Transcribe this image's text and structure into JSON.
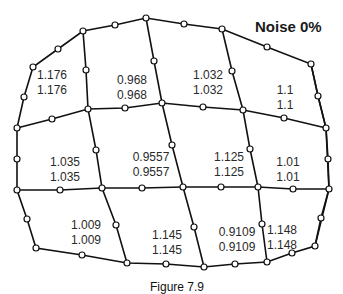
{
  "title": "Noise 0%",
  "caption": "Figure 7.9",
  "colors": {
    "line": "#111111",
    "text": "#2a2a2a",
    "background": "#ffffff"
  },
  "cells": [
    {
      "id": "r1c1",
      "top": "1.176",
      "bottom": "1.176",
      "x": 52,
      "y": 68
    },
    {
      "id": "r1c2",
      "top": "0.968",
      "bottom": "0.968",
      "x": 132,
      "y": 73
    },
    {
      "id": "r1c3",
      "top": "1.032",
      "bottom": "1.032",
      "x": 208,
      "y": 68
    },
    {
      "id": "r1c4",
      "top": "1.1",
      "bottom": "1.1",
      "x": 285,
      "y": 83
    },
    {
      "id": "r2c1",
      "top": "1.035",
      "bottom": "1.035",
      "x": 65,
      "y": 155
    },
    {
      "id": "r2c2",
      "top": "0.9557",
      "bottom": "0.9557",
      "x": 151,
      "y": 150
    },
    {
      "id": "r2c3",
      "top": "1.125",
      "bottom": "1.125",
      "x": 229,
      "y": 150
    },
    {
      "id": "r2c4",
      "top": "1.01",
      "bottom": "1.01",
      "x": 288,
      "y": 155
    },
    {
      "id": "r3c1",
      "top": "1.009",
      "bottom": "1.009",
      "x": 86,
      "y": 218
    },
    {
      "id": "r3c2",
      "top": "1.145",
      "bottom": "1.145",
      "x": 167,
      "y": 228
    },
    {
      "id": "r3c3",
      "top": "0.9109",
      "bottom": "0.9109",
      "x": 237,
      "y": 225
    },
    {
      "id": "r3c4",
      "top": "1.148",
      "bottom": "1.148",
      "x": 282,
      "y": 223
    }
  ],
  "mesh": {
    "polylines": [
      [
        [
          17,
          128
        ],
        [
          24,
          97
        ],
        [
          33,
          67
        ],
        [
          58,
          49
        ],
        [
          83,
          31
        ],
        [
          115,
          25
        ],
        [
          146,
          18
        ],
        [
          184,
          24
        ],
        [
          222,
          29
        ],
        [
          267,
          47
        ],
        [
          311,
          64
        ],
        [
          318,
          96
        ],
        [
          326,
          128
        ],
        [
          328,
          159
        ],
        [
          329,
          189
        ],
        [
          321,
          218
        ],
        [
          315,
          246
        ],
        [
          292,
          253
        ],
        [
          267,
          262
        ],
        [
          235,
          264
        ],
        [
          204,
          267
        ],
        [
          166,
          264
        ],
        [
          127,
          263
        ],
        [
          82,
          255
        ],
        [
          36,
          248
        ],
        [
          27,
          219
        ],
        [
          17,
          190
        ],
        [
          17,
          159
        ],
        [
          17,
          128
        ]
      ],
      [
        [
          17,
          128
        ],
        [
          52,
          119
        ],
        [
          88,
          109
        ],
        [
          125,
          108
        ],
        [
          162,
          103
        ],
        [
          203,
          107
        ],
        [
          243,
          110
        ],
        [
          284,
          118
        ],
        [
          326,
          128
        ]
      ],
      [
        [
          17,
          190
        ],
        [
          60,
          190
        ],
        [
          102,
          188
        ],
        [
          142,
          188
        ],
        [
          183,
          187
        ],
        [
          221,
          187
        ],
        [
          258,
          187
        ],
        [
          293,
          189
        ],
        [
          329,
          189
        ]
      ],
      [
        [
          83,
          31
        ],
        [
          86,
          70
        ],
        [
          88,
          109
        ],
        [
          96,
          150
        ],
        [
          102,
          188
        ],
        [
          116,
          225
        ],
        [
          127,
          263
        ]
      ],
      [
        [
          146,
          18
        ],
        [
          154,
          61
        ],
        [
          162,
          103
        ],
        [
          172,
          145
        ],
        [
          183,
          187
        ],
        [
          194,
          227
        ],
        [
          204,
          267
        ]
      ],
      [
        [
          222,
          29
        ],
        [
          232,
          71
        ],
        [
          243,
          110
        ],
        [
          250,
          149
        ],
        [
          258,
          187
        ],
        [
          262,
          224
        ],
        [
          267,
          262
        ]
      ],
      [
        [
          311,
          64
        ],
        [
          318,
          96
        ],
        [
          326,
          128
        ]
      ],
      [
        [
          326,
          128
        ],
        [
          329,
          189
        ],
        [
          315,
          246
        ]
      ]
    ],
    "nodes": [
      [
        17,
        128
      ],
      [
        24,
        97
      ],
      [
        33,
        67
      ],
      [
        58,
        49
      ],
      [
        83,
        31
      ],
      [
        115,
        25
      ],
      [
        146,
        18
      ],
      [
        184,
        24
      ],
      [
        222,
        29
      ],
      [
        267,
        47
      ],
      [
        311,
        64
      ],
      [
        318,
        96
      ],
      [
        326,
        128
      ],
      [
        52,
        119
      ],
      [
        88,
        109
      ],
      [
        125,
        108
      ],
      [
        162,
        103
      ],
      [
        203,
        107
      ],
      [
        243,
        110
      ],
      [
        284,
        118
      ],
      [
        86,
        70
      ],
      [
        154,
        61
      ],
      [
        232,
        71
      ],
      [
        17,
        159
      ],
      [
        17,
        190
      ],
      [
        60,
        190
      ],
      [
        102,
        188
      ],
      [
        142,
        188
      ],
      [
        183,
        187
      ],
      [
        221,
        187
      ],
      [
        258,
        187
      ],
      [
        293,
        189
      ],
      [
        329,
        189
      ],
      [
        96,
        150
      ],
      [
        172,
        145
      ],
      [
        250,
        149
      ],
      [
        328,
        159
      ],
      [
        27,
        219
      ],
      [
        36,
        248
      ],
      [
        82,
        255
      ],
      [
        127,
        263
      ],
      [
        166,
        264
      ],
      [
        204,
        267
      ],
      [
        235,
        264
      ],
      [
        267,
        262
      ],
      [
        292,
        253
      ],
      [
        315,
        246
      ],
      [
        321,
        218
      ],
      [
        116,
        225
      ],
      [
        194,
        227
      ],
      [
        262,
        224
      ]
    ]
  }
}
